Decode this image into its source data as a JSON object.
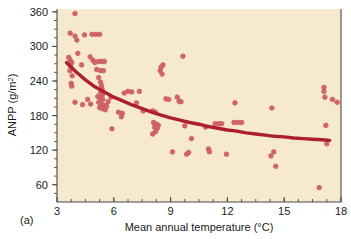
{
  "panel": {
    "label": "(a)"
  },
  "chart_data": {
    "type": "scatter",
    "title": "",
    "subtitle": "",
    "xlabel": "Mean annual temperature (°C)",
    "ylabel_text": "ANPP (g/m",
    "ylabel_sup": "2",
    "ylabel_tail": ")",
    "ylabel": "ANPP (g/m2)",
    "xlim": [
      3,
      18
    ],
    "ylim": [
      30,
      365
    ],
    "xticks": [
      3,
      6,
      9,
      12,
      15,
      18
    ],
    "xtick_labels": [
      "3",
      "6",
      "9",
      "12",
      "15",
      "18"
    ],
    "yticks": [
      60,
      120,
      180,
      240,
      300,
      360
    ],
    "ytick_labels": [
      "60",
      "120",
      "180",
      "240",
      "300",
      "360"
    ],
    "x_minor_interval": 0.75,
    "y_minor_interval": 15,
    "grid": false,
    "legend": null,
    "plot_background_color": "#f6e9ce",
    "point_color": "#d2636b",
    "point_edge_color": "#c2535c",
    "point_radius": 2.4,
    "trend_color": "#ad1f2d",
    "trend_width": 3.4,
    "axis_color": "#4a4a4a",
    "series": [
      {
        "name": "ANPP vs mean annual temperature",
        "points": [
          [
            3.95,
            357
          ],
          [
            3.7,
            323
          ],
          [
            3.95,
            318
          ],
          [
            4.05,
            311
          ],
          [
            4.45,
            320
          ],
          [
            4.85,
            321
          ],
          [
            5.05,
            321
          ],
          [
            5.25,
            321
          ],
          [
            3.62,
            281
          ],
          [
            3.7,
            276
          ],
          [
            3.78,
            272
          ],
          [
            3.72,
            266
          ],
          [
            3.68,
            258
          ],
          [
            3.8,
            249
          ],
          [
            3.75,
            236
          ],
          [
            3.78,
            231
          ],
          [
            3.95,
            203
          ],
          [
            4.1,
            288
          ],
          [
            4.3,
            268
          ],
          [
            4.75,
            282
          ],
          [
            4.9,
            276
          ],
          [
            5.0,
            272
          ],
          [
            5.2,
            274
          ],
          [
            5.35,
            274
          ],
          [
            5.5,
            274
          ],
          [
            5.1,
            260
          ],
          [
            5.3,
            258
          ],
          [
            5.45,
            258
          ],
          [
            5.2,
            246
          ],
          [
            5.3,
            238
          ],
          [
            5.35,
            232
          ],
          [
            5.38,
            226
          ],
          [
            5.3,
            219
          ],
          [
            5.4,
            216
          ],
          [
            5.15,
            213
          ],
          [
            5.3,
            210
          ],
          [
            5.42,
            208
          ],
          [
            5.2,
            203
          ],
          [
            5.35,
            200
          ],
          [
            5.48,
            198
          ],
          [
            5.25,
            194
          ],
          [
            5.4,
            192
          ],
          [
            5.55,
            190
          ],
          [
            5.62,
            196
          ],
          [
            5.7,
            204
          ],
          [
            5.85,
            212
          ],
          [
            4.62,
            208
          ],
          [
            4.78,
            200
          ],
          [
            4.35,
            199
          ],
          [
            5.9,
            157
          ],
          [
            6.25,
            186
          ],
          [
            6.45,
            184
          ],
          [
            6.4,
            178
          ],
          [
            6.55,
            219
          ],
          [
            6.75,
            222
          ],
          [
            6.95,
            221
          ],
          [
            7.35,
            222
          ],
          [
            7.2,
            202
          ],
          [
            7.55,
            188
          ],
          [
            8.05,
            188
          ],
          [
            8.2,
            186
          ],
          [
            8.1,
            168
          ],
          [
            8.25,
            165
          ],
          [
            8.35,
            163
          ],
          [
            8.15,
            160
          ],
          [
            8.3,
            158
          ],
          [
            8.2,
            152
          ],
          [
            8.05,
            148
          ],
          [
            8.45,
            258
          ],
          [
            8.55,
            252
          ],
          [
            8.6,
            268
          ],
          [
            8.5,
            264
          ],
          [
            8.75,
            209
          ],
          [
            8.9,
            208
          ],
          [
            9.1,
            117
          ],
          [
            9.35,
            212
          ],
          [
            9.45,
            205
          ],
          [
            9.55,
            204
          ],
          [
            9.65,
            283
          ],
          [
            9.75,
            162
          ],
          [
            9.85,
            113
          ],
          [
            9.95,
            116
          ],
          [
            10.1,
            140
          ],
          [
            10.85,
            160
          ],
          [
            11.0,
            122
          ],
          [
            11.05,
            117
          ],
          [
            11.35,
            166
          ],
          [
            11.55,
            166
          ],
          [
            11.7,
            166
          ],
          [
            11.95,
            113
          ],
          [
            12.35,
            168
          ],
          [
            12.55,
            168
          ],
          [
            12.75,
            168
          ],
          [
            12.4,
            202
          ],
          [
            14.35,
            193
          ],
          [
            14.3,
            110
          ],
          [
            14.45,
            117
          ],
          [
            14.55,
            92
          ],
          [
            16.85,
            55
          ],
          [
            17.1,
            229
          ],
          [
            17.1,
            222
          ],
          [
            17.15,
            212
          ],
          [
            17.2,
            163
          ],
          [
            17.25,
            131
          ],
          [
            17.55,
            208
          ],
          [
            17.8,
            203
          ]
        ]
      }
    ],
    "trend_line": {
      "name": "fitted decline curve",
      "points": [
        [
          3.5,
          272
        ],
        [
          4.0,
          256
        ],
        [
          4.5,
          242
        ],
        [
          5.0,
          230
        ],
        [
          5.5,
          221
        ],
        [
          6.0,
          212
        ],
        [
          6.5,
          205
        ],
        [
          7.0,
          198
        ],
        [
          7.5,
          192
        ],
        [
          8.0,
          186
        ],
        [
          8.5,
          181
        ],
        [
          9.0,
          176
        ],
        [
          9.5,
          172
        ],
        [
          10.0,
          168
        ],
        [
          10.5,
          165
        ],
        [
          11.0,
          161
        ],
        [
          11.5,
          158
        ],
        [
          12.0,
          155
        ],
        [
          12.5,
          153
        ],
        [
          13.0,
          150
        ],
        [
          13.5,
          148
        ],
        [
          14.0,
          146
        ],
        [
          14.5,
          144
        ],
        [
          15.0,
          143
        ],
        [
          15.5,
          141
        ],
        [
          16.0,
          140
        ],
        [
          16.5,
          139
        ],
        [
          17.0,
          138
        ],
        [
          17.4,
          137
        ]
      ]
    }
  }
}
